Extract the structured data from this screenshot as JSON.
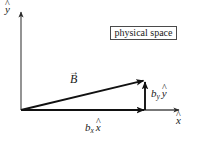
{
  "figure": {
    "width": 205,
    "height": 142,
    "background_color": "#ffffff",
    "ink_color": "#1a1a1a"
  },
  "annotation_box": {
    "text": "physical space",
    "border_color": "#4a4a4a",
    "fill_color": "#ffffff"
  },
  "axes": {
    "y_axis": {
      "label_base": "y",
      "label_accent": "^",
      "label_full": "ŷ",
      "origin": [
        21,
        110
      ],
      "tip": [
        21,
        10
      ]
    },
    "x_axis": {
      "label_base": "x",
      "label_accent": "^",
      "label_full": "x̂",
      "origin": [
        21,
        110
      ],
      "tip": [
        181,
        110
      ]
    }
  },
  "vectors": {
    "main": {
      "label_base": "B",
      "label_accent": "→",
      "label_full": "B⃗",
      "from": [
        21,
        110
      ],
      "to": [
        145,
        80
      ]
    },
    "y_component": {
      "label_base": "b",
      "label_subscript": "y",
      "label_unit_base": "y",
      "label_unit_accent": "^",
      "label_full": "b_y ŷ",
      "from": [
        145,
        110
      ],
      "to": [
        145,
        80
      ]
    },
    "x_component": {
      "label_base": "b",
      "label_subscript": "x",
      "label_unit_base": "x",
      "label_unit_accent": "^",
      "label_full": "b_x x̂",
      "from": [
        21,
        110
      ],
      "to": [
        145,
        110
      ]
    }
  }
}
